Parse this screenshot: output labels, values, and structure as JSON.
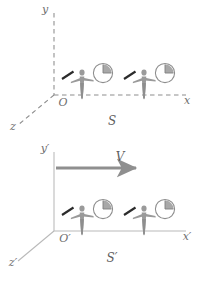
{
  "figure": {
    "type": "physics-diagram",
    "topic": "special-relativity-reference-frames",
    "background_color": "#ffffff",
    "axis_color": "#8d8d8d",
    "figure_color": "#9a9a9a",
    "rod_color": "#2e2e2e",
    "clock_color": "#8d8d8d",
    "label_color": "#6e6e6e",
    "arrow_color": "#8f8f8f"
  },
  "frames": [
    {
      "id": "frame-s",
      "name": "S",
      "frame_label": "S",
      "origin_label": "O",
      "axes": [
        {
          "name": "y-axis",
          "label": "y",
          "direction": "up",
          "style": "dashed"
        },
        {
          "name": "x-axis",
          "label": "x",
          "direction": "right",
          "style": "dashed"
        },
        {
          "name": "z-axis",
          "label": "z",
          "direction": "down-left",
          "style": "dashed"
        }
      ],
      "observers": [
        {
          "name": "observer-1",
          "rod": "diagonal-rod",
          "clock": {
            "name": "clock-1",
            "wedge_from_hour": 12,
            "wedge_to_hour": 3
          }
        },
        {
          "name": "observer-2",
          "rod": "diagonal-rod",
          "clock": {
            "name": "clock-2",
            "wedge_from_hour": 12,
            "wedge_to_hour": 3
          }
        }
      ],
      "velocity_arrow": null
    },
    {
      "id": "frame-s-prime",
      "name": "S'",
      "frame_label": "S'",
      "origin_label": "O'",
      "axes": [
        {
          "name": "y-prime-axis",
          "label": "y'",
          "direction": "up",
          "style": "solid"
        },
        {
          "name": "x-prime-axis",
          "label": "x'",
          "direction": "right",
          "style": "solid"
        },
        {
          "name": "z-prime-axis",
          "label": "z'",
          "direction": "down-left",
          "style": "solid"
        }
      ],
      "observers": [
        {
          "name": "observer-3",
          "rod": "diagonal-rod",
          "clock": {
            "name": "clock-3",
            "wedge_from_hour": 12,
            "wedge_to_hour": 3
          }
        },
        {
          "name": "observer-4",
          "rod": "diagonal-rod",
          "clock": {
            "name": "clock-4",
            "wedge_from_hour": 12,
            "wedge_to_hour": 3
          }
        }
      ],
      "velocity_arrow": {
        "name": "velocity-arrow",
        "label": "V",
        "direction": "right"
      }
    }
  ],
  "labels": {
    "y": "y",
    "x": "x",
    "z": "z",
    "O": "O",
    "S": "S",
    "y_prime": "y′",
    "x_prime": "x′",
    "z_prime": "z′",
    "O_prime": "O′",
    "S_prime": "S′",
    "V": "V"
  }
}
